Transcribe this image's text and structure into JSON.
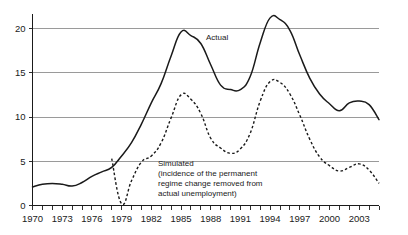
{
  "chart_data": {
    "type": "line",
    "title": "",
    "subtitle": "",
    "xlabel": "",
    "ylabel": "",
    "xlim": [
      1970,
      2005
    ],
    "ylim": [
      0,
      22
    ],
    "grid": "horizontal-only",
    "legend_position": "inline-annotation",
    "y_ticks": [
      "0",
      "5",
      "10",
      "15",
      "20"
    ],
    "y_tick_values": [
      0,
      5,
      10,
      15,
      20
    ],
    "x_tick_labels": [
      "1970",
      "1973",
      "1976",
      "1979",
      "1982",
      "1985",
      "1988",
      "1991",
      "1994",
      "1997",
      "2000",
      "2003"
    ],
    "x_tick_values": [
      1970,
      1973,
      1976,
      1979,
      1982,
      1985,
      1988,
      1991,
      1994,
      1997,
      2000,
      2003
    ],
    "x_minor_tick_interval": 1,
    "series": [
      {
        "name": "Actual",
        "style": "solid",
        "label": "Actual",
        "x": [
          1970,
          1971,
          1972,
          1973,
          1974,
          1975,
          1976,
          1977,
          1978,
          1979,
          1980,
          1981,
          1982,
          1983,
          1984,
          1985,
          1986,
          1987,
          1988,
          1989,
          1990,
          1991,
          1992,
          1993,
          1994,
          1995,
          1996,
          1997,
          1998,
          1999,
          2000,
          2001,
          2002,
          2003,
          2004,
          2005
        ],
        "values": [
          2.1,
          2.4,
          2.5,
          2.4,
          2.2,
          2.6,
          3.3,
          3.8,
          4.3,
          5.6,
          7.1,
          9.2,
          11.6,
          13.8,
          16.9,
          19.6,
          19.2,
          18.3,
          15.9,
          13.6,
          13.1,
          13.1,
          14.6,
          18.4,
          21.2,
          21.0,
          19.8,
          17.0,
          14.4,
          12.6,
          11.5,
          10.7,
          11.6,
          11.8,
          11.4,
          9.7
        ]
      },
      {
        "name": "Simulated",
        "style": "dashed",
        "label": "Simulated",
        "annotation": [
          "Simulated",
          "(incidence of the permanent",
          "regime change removed from",
          "actual unemployment)"
        ],
        "x": [
          1978,
          1979,
          1980,
          1981,
          1982,
          1983,
          1984,
          1985,
          1986,
          1987,
          1988,
          1989,
          1990,
          1991,
          1992,
          1993,
          1994,
          1995,
          1996,
          1997,
          1998,
          1999,
          2000,
          2001,
          2002,
          2003,
          2004,
          2005
        ],
        "values": [
          5.3,
          0.2,
          2.8,
          4.9,
          5.6,
          7.1,
          9.9,
          12.5,
          12.0,
          10.4,
          7.6,
          6.5,
          5.9,
          6.4,
          8.2,
          11.8,
          14.0,
          13.9,
          12.6,
          10.2,
          7.5,
          5.5,
          4.5,
          3.9,
          4.3,
          4.7,
          4.0,
          2.5
        ]
      }
    ]
  },
  "labels": {
    "actual": "Actual",
    "simulated_l1": "Simulated",
    "simulated_l2": "(incidence of the permanent",
    "simulated_l3": "regime change removed from",
    "simulated_l4": "actual unemployment)"
  },
  "colors": {
    "line": "#1a1a1a",
    "grid": "#9a9a9a",
    "background": "#ffffff"
  }
}
